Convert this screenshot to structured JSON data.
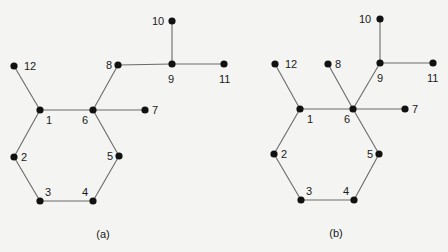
{
  "figure": {
    "background": "#f4f4f2",
    "edge_color": "#6a6a6a",
    "node_color": "#111111",
    "panels": [
      {
        "id": "a",
        "caption": "(a)",
        "caption_pos": [
          103,
          238
        ],
        "nodes": [
          {
            "id": "1",
            "label": "1",
            "x": 40,
            "y": 110,
            "lx": 46,
            "ly": 124
          },
          {
            "id": "2",
            "label": "2",
            "x": 14,
            "y": 157,
            "lx": 21,
            "ly": 161
          },
          {
            "id": "3",
            "label": "3",
            "x": 40,
            "y": 201,
            "lx": 45,
            "ly": 196
          },
          {
            "id": "4",
            "label": "4",
            "x": 93,
            "y": 201,
            "lx": 82,
            "ly": 196
          },
          {
            "id": "5",
            "label": "5",
            "x": 119,
            "y": 156,
            "lx": 107,
            "ly": 160
          },
          {
            "id": "6",
            "label": "6",
            "x": 93,
            "y": 110,
            "lx": 82,
            "ly": 124
          },
          {
            "id": "7",
            "label": "7",
            "x": 145,
            "y": 110,
            "lx": 152,
            "ly": 114
          },
          {
            "id": "8",
            "label": "8",
            "x": 118,
            "y": 65,
            "lx": 106,
            "ly": 69
          },
          {
            "id": "9",
            "label": "9",
            "x": 172,
            "y": 64,
            "lx": 168,
            "ly": 83
          },
          {
            "id": "10",
            "label": "10",
            "x": 172,
            "y": 21,
            "lx": 152,
            "ly": 25
          },
          {
            "id": "11",
            "label": "11",
            "x": 224,
            "y": 64,
            "lx": 219,
            "ly": 83
          },
          {
            "id": "12",
            "label": "12",
            "x": 14,
            "y": 66,
            "lx": 24,
            "ly": 70
          }
        ],
        "edges": [
          [
            "1",
            "2"
          ],
          [
            "2",
            "3"
          ],
          [
            "3",
            "4"
          ],
          [
            "4",
            "5"
          ],
          [
            "5",
            "6"
          ],
          [
            "6",
            "1"
          ],
          [
            "1",
            "12"
          ],
          [
            "6",
            "7"
          ],
          [
            "6",
            "8"
          ],
          [
            "8",
            "9"
          ],
          [
            "9",
            "10"
          ],
          [
            "9",
            "11"
          ]
        ]
      },
      {
        "id": "b",
        "caption": "(b)",
        "caption_pos": [
          336,
          237
        ],
        "nodes": [
          {
            "id": "1",
            "label": "1",
            "x": 300,
            "y": 109,
            "lx": 307,
            "ly": 123
          },
          {
            "id": "2",
            "label": "2",
            "x": 274,
            "y": 154,
            "lx": 281,
            "ly": 158
          },
          {
            "id": "3",
            "label": "3",
            "x": 301,
            "y": 200,
            "lx": 306,
            "ly": 195
          },
          {
            "id": "4",
            "label": "4",
            "x": 354,
            "y": 200,
            "lx": 343,
            "ly": 195
          },
          {
            "id": "5",
            "label": "5",
            "x": 379,
            "y": 154,
            "lx": 367,
            "ly": 158
          },
          {
            "id": "6",
            "label": "6",
            "x": 353,
            "y": 109,
            "lx": 344,
            "ly": 123
          },
          {
            "id": "7",
            "label": "7",
            "x": 405,
            "y": 109,
            "lx": 412,
            "ly": 113
          },
          {
            "id": "8",
            "label": "8",
            "x": 328,
            "y": 64,
            "lx": 335,
            "ly": 68
          },
          {
            "id": "9",
            "label": "9",
            "x": 380,
            "y": 63,
            "lx": 377,
            "ly": 82
          },
          {
            "id": "10",
            "label": "10",
            "x": 380,
            "y": 19,
            "lx": 359,
            "ly": 23
          },
          {
            "id": "11",
            "label": "11",
            "x": 433,
            "y": 63,
            "lx": 427,
            "ly": 82
          },
          {
            "id": "12",
            "label": "12",
            "x": 275,
            "y": 64,
            "lx": 285,
            "ly": 68
          }
        ],
        "edges": [
          [
            "1",
            "2"
          ],
          [
            "2",
            "3"
          ],
          [
            "3",
            "4"
          ],
          [
            "4",
            "5"
          ],
          [
            "5",
            "6"
          ],
          [
            "6",
            "1"
          ],
          [
            "1",
            "12"
          ],
          [
            "6",
            "7"
          ],
          [
            "6",
            "8"
          ],
          [
            "6",
            "9"
          ],
          [
            "9",
            "10"
          ],
          [
            "9",
            "11"
          ]
        ]
      }
    ]
  }
}
